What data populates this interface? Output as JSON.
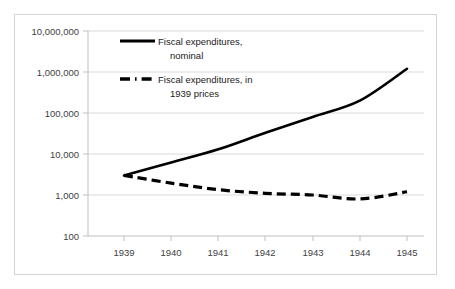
{
  "chart_data": {
    "type": "line",
    "title": "",
    "xlabel": "",
    "ylabel": "",
    "scale": "log",
    "grid": true,
    "legend_position": "inside-top-left",
    "x": [
      1939,
      1940,
      1941,
      1942,
      1943,
      1944,
      1945
    ],
    "categories": [
      "1939",
      "1940",
      "1941",
      "1942",
      "1943",
      "1944",
      "1945"
    ],
    "ylim": [
      100,
      10000000
    ],
    "ytick_labels": [
      "10,000,000",
      "1,000,000",
      "100,000",
      "10,000",
      "1,000",
      "100"
    ],
    "ytick_values": [
      10000000,
      1000000,
      100000,
      10000,
      1000,
      100
    ],
    "series": [
      {
        "name": "Fiscal expenditures, nominal",
        "style": "solid",
        "color": "#000000",
        "values": [
          3000,
          6200,
          13000,
          33000,
          80000,
          200000,
          1200000
        ]
      },
      {
        "name": "Fiscal expenditures, in 1939 prices",
        "style": "dashed",
        "color": "#000000",
        "values": [
          3000,
          1950,
          1350,
          1100,
          1000,
          800,
          1200
        ]
      }
    ]
  },
  "legend": {
    "items": [
      {
        "line1": "Fiscal expenditures,",
        "line2": "nominal",
        "style": "solid"
      },
      {
        "line1": "Fiscal expenditures, in",
        "line2": "1939 prices",
        "style": "dashed"
      }
    ]
  },
  "axes": {
    "y_labels": [
      "10,000,000",
      "1,000,000",
      "100,000",
      "10,000",
      "1,000",
      "100"
    ],
    "x_labels": [
      "1939",
      "1940",
      "1941",
      "1942",
      "1943",
      "1944",
      "1945"
    ]
  },
  "colors": {
    "line": "#000000",
    "grid": "#d9d9d9",
    "axis": "#bfbfbf",
    "frame": "#d4d4d4",
    "tick_text": "#3f3f3f",
    "background": "#ffffff"
  }
}
